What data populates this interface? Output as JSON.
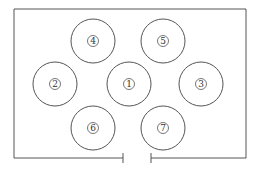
{
  "diagram": {
    "stroke_color": "#555555",
    "background": "#ffffff",
    "enclosure": {
      "left": 14,
      "right": 246,
      "top": 9,
      "bottom": 158,
      "gap_left": 123,
      "gap_right": 151,
      "tick_top": 153,
      "tick_bottom": 163
    },
    "circles": [
      {
        "id": "1",
        "label": "1",
        "cx": 129,
        "cy": 84,
        "r": 22
      },
      {
        "id": "2",
        "label": "2",
        "cx": 55,
        "cy": 84,
        "r": 22
      },
      {
        "id": "3",
        "label": "3",
        "cx": 201,
        "cy": 84,
        "r": 22
      },
      {
        "id": "4",
        "label": "4",
        "cx": 93,
        "cy": 41,
        "r": 22
      },
      {
        "id": "5",
        "label": "5",
        "cx": 163,
        "cy": 41,
        "r": 22
      },
      {
        "id": "6",
        "label": "6",
        "cx": 93,
        "cy": 128,
        "r": 22
      },
      {
        "id": "7",
        "label": "7",
        "cx": 163,
        "cy": 128,
        "r": 22
      }
    ]
  }
}
